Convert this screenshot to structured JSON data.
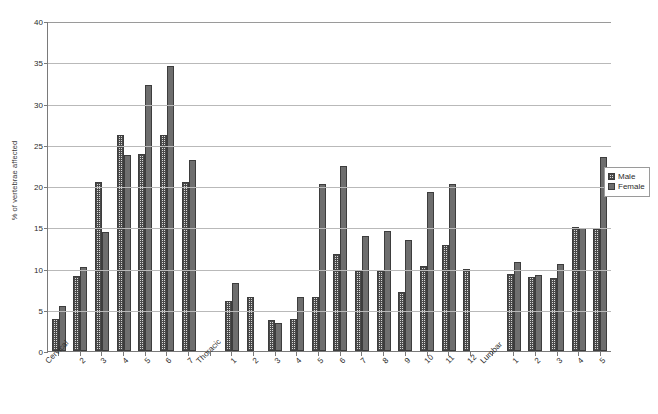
{
  "top_artifact": "",
  "legend": {
    "position": "right",
    "entries": [
      {
        "label": "Male",
        "style": "hatched",
        "color": "#d9d9d9"
      },
      {
        "label": "Female",
        "style": "solid",
        "color": "#6e6e6e"
      }
    ]
  },
  "chart_data": {
    "type": "bar",
    "title": "",
    "xlabel": "",
    "ylabel": "% of vertebrae affected",
    "ylim": [
      0,
      40
    ],
    "ytick_step": 5,
    "yticks": [
      0,
      5,
      10,
      15,
      20,
      25,
      30,
      35,
      40
    ],
    "grid": true,
    "legend_position": "right",
    "categories": [
      "Cervical",
      "2",
      "3",
      "4",
      "5",
      "6",
      "7",
      "Thoracic",
      "1",
      "2",
      "3",
      "4",
      "5",
      "6",
      "7",
      "8",
      "9",
      "10",
      "11",
      "12",
      "Lumbar",
      "1",
      "2",
      "3",
      "4",
      "5"
    ],
    "series": [
      {
        "name": "Male",
        "values": [
          3.9,
          9.1,
          20.5,
          26.2,
          23.9,
          26.2,
          20.5,
          null,
          6.1,
          6.6,
          3.8,
          3.9,
          6.6,
          11.8,
          9.7,
          9.7,
          7.1,
          10.3,
          12.8,
          10.0,
          null,
          9.3,
          9.0,
          8.8,
          15.0,
          14.8
        ]
      },
      {
        "name": "Female",
        "values": [
          5.4,
          10.2,
          14.4,
          23.7,
          32.2,
          34.6,
          23.2,
          null,
          8.3,
          null,
          3.4,
          6.5,
          20.3,
          22.4,
          13.9,
          14.6,
          13.5,
          19.3,
          20.3,
          null,
          null,
          10.8,
          9.2,
          10.5,
          14.9,
          23.5
        ]
      }
    ]
  }
}
